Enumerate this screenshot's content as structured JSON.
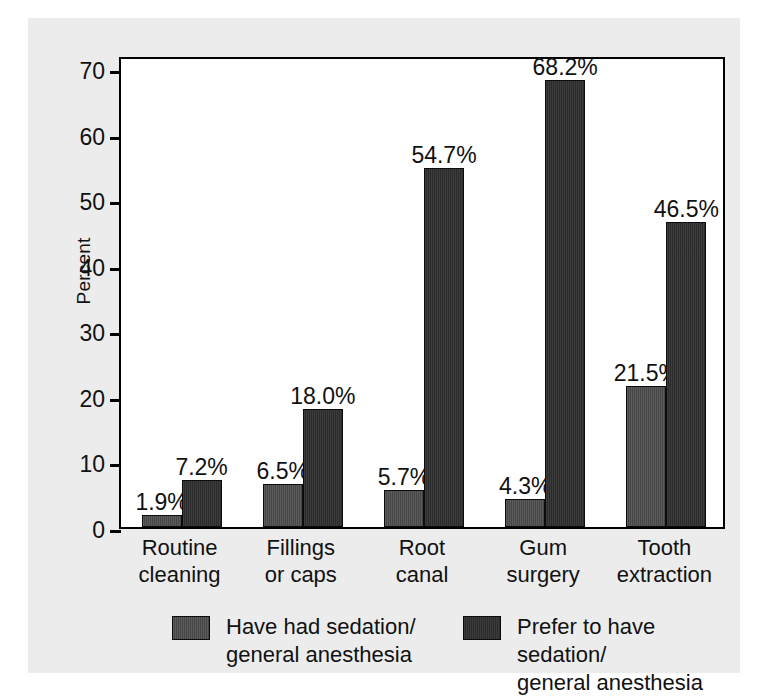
{
  "chart_data": {
    "type": "bar",
    "title": "",
    "xlabel": "",
    "ylabel": "Percent",
    "ylim": [
      0,
      72
    ],
    "yticks": [
      0,
      10,
      20,
      30,
      40,
      50,
      60,
      70
    ],
    "ytick_labels": [
      "0",
      "10",
      "20",
      "30",
      "40",
      "50",
      "60",
      "70"
    ],
    "grid": false,
    "legend_position": "bottom",
    "categories": [
      "Routine\ncleaning",
      "Fillings\nor caps",
      "Root\ncanal",
      "Gum\nsurgery",
      "Tooth\nextraction"
    ],
    "series": [
      {
        "name": "Have had sedation/\ngeneral anesthesia",
        "color": "#4a4a4a",
        "values": [
          1.9,
          6.5,
          5.7,
          4.3,
          21.5
        ],
        "value_labels": [
          "1.9%",
          "6.5%",
          "5.7%",
          "4.3%",
          "21.5%"
        ]
      },
      {
        "name": "Prefer to have sedation/\ngeneral anesthesia",
        "color": "#2e2e2e",
        "values": [
          7.2,
          18.0,
          54.7,
          68.2,
          46.5
        ],
        "value_labels": [
          "7.2%",
          "18.0%",
          "54.7%",
          "68.2%",
          "46.5%"
        ]
      }
    ]
  },
  "legend": {
    "items": [
      {
        "label": "Have had sedation/\ngeneral anesthesia",
        "swatch": "series-0-swatch"
      },
      {
        "label": "Prefer to have sedation/\ngeneral anesthesia",
        "swatch": "series-1-swatch"
      }
    ]
  },
  "colors": {
    "figure_background": "#ececec",
    "plot_background": "#ffffff",
    "axis": "#000000",
    "text": "#111111",
    "series_0": "#4a4a4a",
    "series_1": "#2e2e2e"
  }
}
